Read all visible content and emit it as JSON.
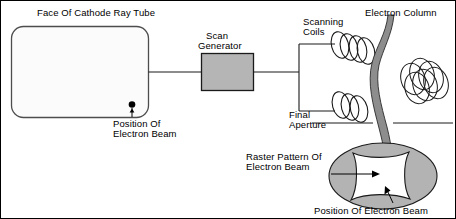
{
  "figure": {
    "kind": "technical-diagram",
    "background_color": "#ffffff",
    "border_color": "#000000",
    "line_color": "#1a1a1a",
    "fill_gray": "#b3b3b3",
    "crt_fill": "#fbfbfb",
    "crt_stroke": "#555555"
  },
  "labels": {
    "crt_face": "Face Of Cathode Ray Tube",
    "position_of_electron_beam_crt_line1": "Position Of",
    "position_of_electron_beam_crt_line2": "Electron Beam",
    "scan_generator_line1": "Scan",
    "scan_generator_line2": "Generator",
    "scanning_coils_line1": "Scanning",
    "scanning_coils_line2": "Coils",
    "electron_column": "Electron Column",
    "final_aperture_line1": "Final",
    "final_aperture_line2": "Aperture",
    "raster_pattern_line1": "Raster Pattern Of",
    "raster_pattern_line2": "Electron Beam",
    "position_of_electron_beam_raster": "Position Of Electron Beam"
  },
  "components": {
    "crt_screen": {
      "name": "Face Of Cathode Ray Tube",
      "shape": "rounded-rectangle",
      "x": 10,
      "y": 25,
      "width": 138,
      "height": 92,
      "corner_radius": 12
    },
    "beam_spot_crt": {
      "name": "Position Of Electron Beam",
      "shape": "dot",
      "cx": 131,
      "cy": 104,
      "r": 3.2
    },
    "scan_generator": {
      "name": "Scan Generator",
      "shape": "filled-rectangle",
      "x": 200,
      "y": 52,
      "width": 53,
      "height": 38,
      "fill": "#b3b3b3"
    },
    "scanning_coils": {
      "name": "Scanning Coils",
      "count_sets": 2,
      "rings_per_set": 3
    },
    "electron_column": {
      "name": "Electron Column",
      "shape": "curved-band",
      "fill": "#8f8f8f"
    },
    "coil_winding_cluster": {
      "name": "coil-winding-cluster",
      "rings": 6
    },
    "raster_display": {
      "name": "Raster Pattern Of Electron Beam",
      "shape": "ellipse-with-pincushion",
      "ellipse_cx": 382,
      "ellipse_cy": 175,
      "ellipse_rx": 54,
      "ellipse_ry": 33,
      "ellipse_fill": "#b3b3b3",
      "pattern_fill": "#ffffff"
    },
    "beam_spot_raster": {
      "name": "Position Of Electron Beam",
      "shape": "arrow-target"
    }
  },
  "connections": [
    {
      "from": "crt_screen",
      "to": "scan_generator",
      "type": "wire"
    },
    {
      "from": "scan_generator",
      "to": "scanning_coils_bracket",
      "type": "wire"
    },
    {
      "from": "scanning_coils_bracket",
      "to": "upper_coil_set",
      "type": "wire"
    },
    {
      "from": "scanning_coils_bracket",
      "to": "lower_coil_set",
      "type": "wire"
    }
  ]
}
